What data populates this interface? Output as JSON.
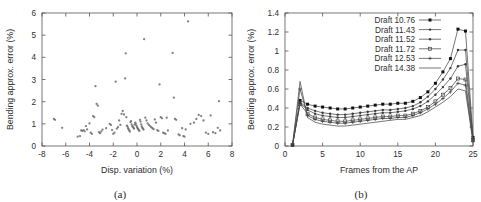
{
  "figure": {
    "panels": [
      {
        "caption": "(a)",
        "chart_data": {
          "type": "scatter",
          "title": "",
          "xlabel": "Disp. variation (%)",
          "ylabel": "Bending approx. error (%)",
          "xlim": [
            -8,
            8
          ],
          "ylim": [
            0,
            6
          ],
          "xticks": [
            -8,
            -6,
            -4,
            -2,
            0,
            2,
            4,
            6,
            8
          ],
          "xticklabels": [
            "-8",
            "-6",
            "-4",
            "-2",
            "0",
            "2",
            "4",
            "6",
            "8"
          ],
          "yticks": [
            0,
            1,
            2,
            3,
            4,
            5,
            6
          ],
          "yticklabels": [
            "0",
            "1",
            "2",
            "3",
            "4",
            "5",
            "6"
          ],
          "grid": false,
          "legend": "none",
          "marker": "dot",
          "points": [
            [
              -7.0,
              1.22
            ],
            [
              -6.9,
              1.18
            ],
            [
              -6.3,
              0.82
            ],
            [
              -5.0,
              0.42
            ],
            [
              -4.8,
              0.45
            ],
            [
              -4.7,
              0.7
            ],
            [
              -4.6,
              0.68
            ],
            [
              -4.5,
              0.72
            ],
            [
              -4.4,
              0.66
            ],
            [
              -4.3,
              0.9
            ],
            [
              -4.2,
              0.75
            ],
            [
              -4.0,
              1.02
            ],
            [
              -3.9,
              0.6
            ],
            [
              -3.8,
              0.55
            ],
            [
              -3.7,
              1.35
            ],
            [
              -3.6,
              1.3
            ],
            [
              -3.5,
              2.7
            ],
            [
              -3.4,
              1.9
            ],
            [
              -3.3,
              1.82
            ],
            [
              -3.2,
              0.62
            ],
            [
              -3.1,
              0.58
            ],
            [
              -3.0,
              0.66
            ],
            [
              -2.9,
              0.74
            ],
            [
              -2.6,
              0.8
            ],
            [
              -2.3,
              1.0
            ],
            [
              -2.2,
              0.95
            ],
            [
              -2.1,
              0.72
            ],
            [
              -2.0,
              0.55
            ],
            [
              -1.9,
              0.6
            ],
            [
              -1.8,
              2.9
            ],
            [
              -1.7,
              0.78
            ],
            [
              -1.6,
              0.85
            ],
            [
              -1.5,
              1.15
            ],
            [
              -1.4,
              0.95
            ],
            [
              -1.3,
              1.45
            ],
            [
              -1.2,
              1.58
            ],
            [
              -1.1,
              1.42
            ],
            [
              -1.0,
              3.05
            ],
            [
              -0.95,
              4.18
            ],
            [
              -0.9,
              1.3
            ],
            [
              -0.85,
              0.92
            ],
            [
              -0.8,
              0.88
            ],
            [
              -0.75,
              0.8
            ],
            [
              -0.7,
              0.75
            ],
            [
              -0.65,
              0.7
            ],
            [
              -0.6,
              0.65
            ],
            [
              -0.55,
              1.08
            ],
            [
              -0.5,
              1.12
            ],
            [
              -0.45,
              0.98
            ],
            [
              -0.4,
              0.9
            ],
            [
              -0.35,
              0.86
            ],
            [
              -0.3,
              0.82
            ],
            [
              -0.25,
              0.78
            ],
            [
              -0.2,
              0.96
            ],
            [
              -0.15,
              1.05
            ],
            [
              -0.1,
              1.0
            ],
            [
              -0.05,
              0.92
            ],
            [
              0.0,
              0.86
            ],
            [
              0.05,
              0.8
            ],
            [
              0.1,
              0.76
            ],
            [
              0.15,
              0.72
            ],
            [
              0.2,
              0.68
            ],
            [
              0.25,
              1.18
            ],
            [
              0.3,
              1.1
            ],
            [
              0.35,
              0.98
            ],
            [
              0.4,
              0.88
            ],
            [
              0.45,
              0.82
            ],
            [
              0.5,
              0.78
            ],
            [
              0.55,
              0.74
            ],
            [
              0.6,
              4.82
            ],
            [
              0.7,
              1.28
            ],
            [
              0.8,
              1.15
            ],
            [
              0.9,
              1.02
            ],
            [
              1.0,
              0.95
            ],
            [
              1.1,
              0.9
            ],
            [
              1.2,
              0.85
            ],
            [
              1.3,
              0.8
            ],
            [
              1.4,
              0.76
            ],
            [
              1.5,
              1.2
            ],
            [
              1.6,
              1.05
            ],
            [
              1.7,
              0.72
            ],
            [
              1.8,
              0.68
            ],
            [
              1.9,
              2.78
            ],
            [
              2.0,
              1.3
            ],
            [
              2.1,
              1.25
            ],
            [
              2.2,
              0.6
            ],
            [
              2.3,
              0.58
            ],
            [
              2.4,
              0.55
            ],
            [
              2.5,
              1.28
            ],
            [
              2.6,
              0.7
            ],
            [
              3.0,
              4.2
            ],
            [
              3.1,
              2.18
            ],
            [
              3.2,
              1.22
            ],
            [
              3.3,
              1.18
            ],
            [
              3.5,
              0.52
            ],
            [
              3.6,
              0.48
            ],
            [
              3.8,
              0.8
            ],
            [
              3.9,
              0.45
            ],
            [
              4.0,
              0.42
            ],
            [
              4.1,
              0.75
            ],
            [
              4.3,
              5.62
            ],
            [
              4.5,
              1.0
            ],
            [
              4.8,
              1.05
            ],
            [
              5.0,
              1.22
            ],
            [
              5.2,
              1.4
            ],
            [
              5.4,
              1.35
            ],
            [
              5.6,
              1.15
            ],
            [
              5.8,
              0.6
            ],
            [
              6.0,
              0.55
            ],
            [
              6.2,
              1.38
            ],
            [
              6.4,
              0.62
            ],
            [
              6.6,
              0.58
            ],
            [
              6.8,
              0.82
            ],
            [
              6.9,
              2.02
            ],
            [
              7.0,
              0.7
            ]
          ]
        }
      },
      {
        "caption": "(b)",
        "chart_data": {
          "type": "line",
          "title": "",
          "xlabel": "Frames from the AP",
          "ylabel": "Bending approx. error (%)",
          "xlim": [
            0,
            25
          ],
          "ylim": [
            0,
            1.4
          ],
          "xticks": [
            0,
            5,
            10,
            15,
            20,
            25
          ],
          "xticklabels": [
            "0",
            "5",
            "10",
            "15",
            "20",
            "25"
          ],
          "yticks": [
            0,
            0.2,
            0.4,
            0.6,
            0.8,
            1,
            1.2,
            1.4
          ],
          "yticklabels": [
            "0",
            "0.2",
            "0.4",
            "0.6",
            "0.8",
            "1",
            "1.2",
            "1.4"
          ],
          "grid": false,
          "legend": "top-right",
          "x": [
            1,
            2,
            3,
            4,
            5,
            6,
            7,
            8,
            9,
            10,
            11,
            12,
            13,
            14,
            15,
            16,
            17,
            18,
            19,
            20,
            21,
            22,
            23,
            24,
            25
          ],
          "series": [
            {
              "name": "Draft 10.76",
              "marker": "filled-square",
              "values": [
                0.01,
                0.48,
                0.44,
                0.42,
                0.41,
                0.4,
                0.39,
                0.39,
                0.4,
                0.41,
                0.42,
                0.43,
                0.44,
                0.44,
                0.45,
                0.45,
                0.47,
                0.51,
                0.57,
                0.66,
                0.78,
                0.92,
                1.23,
                1.21,
                0.09
              ]
            },
            {
              "name": "Draft 11.43",
              "marker": "small-dot",
              "values": [
                0.01,
                0.46,
                0.4,
                0.37,
                0.35,
                0.34,
                0.33,
                0.33,
                0.34,
                0.35,
                0.36,
                0.37,
                0.38,
                0.38,
                0.39,
                0.4,
                0.42,
                0.46,
                0.52,
                0.6,
                0.7,
                0.82,
                1.01,
                1.01,
                0.08
              ]
            },
            {
              "name": "Draft 11.52",
              "marker": "small-dot",
              "values": [
                0.01,
                0.45,
                0.38,
                0.34,
                0.32,
                0.31,
                0.3,
                0.3,
                0.31,
                0.32,
                0.33,
                0.34,
                0.35,
                0.35,
                0.36,
                0.37,
                0.39,
                0.42,
                0.47,
                0.54,
                0.62,
                0.71,
                0.84,
                0.86,
                0.07
              ]
            },
            {
              "name": "Draft 11.72",
              "marker": "open-square",
              "values": [
                0.01,
                0.44,
                0.34,
                0.3,
                0.28,
                0.27,
                0.26,
                0.26,
                0.27,
                0.28,
                0.29,
                0.3,
                0.31,
                0.31,
                0.32,
                0.32,
                0.34,
                0.37,
                0.41,
                0.47,
                0.54,
                0.61,
                0.71,
                0.7,
                0.06
              ]
            },
            {
              "name": "Draft 12.53",
              "marker": "cross",
              "values": [
                0.01,
                0.6,
                0.32,
                0.28,
                0.26,
                0.25,
                0.24,
                0.24,
                0.25,
                0.26,
                0.27,
                0.28,
                0.29,
                0.29,
                0.3,
                0.3,
                0.32,
                0.35,
                0.39,
                0.44,
                0.5,
                0.57,
                0.66,
                0.64,
                0.05
              ]
            },
            {
              "name": "Draft 14.38",
              "marker": "line",
              "values": [
                0.01,
                0.68,
                0.3,
                0.25,
                0.23,
                0.22,
                0.21,
                0.21,
                0.22,
                0.23,
                0.24,
                0.25,
                0.26,
                0.27,
                0.28,
                0.28,
                0.3,
                0.32,
                0.36,
                0.41,
                0.46,
                0.52,
                0.6,
                0.58,
                0.04
              ]
            }
          ]
        }
      }
    ]
  }
}
